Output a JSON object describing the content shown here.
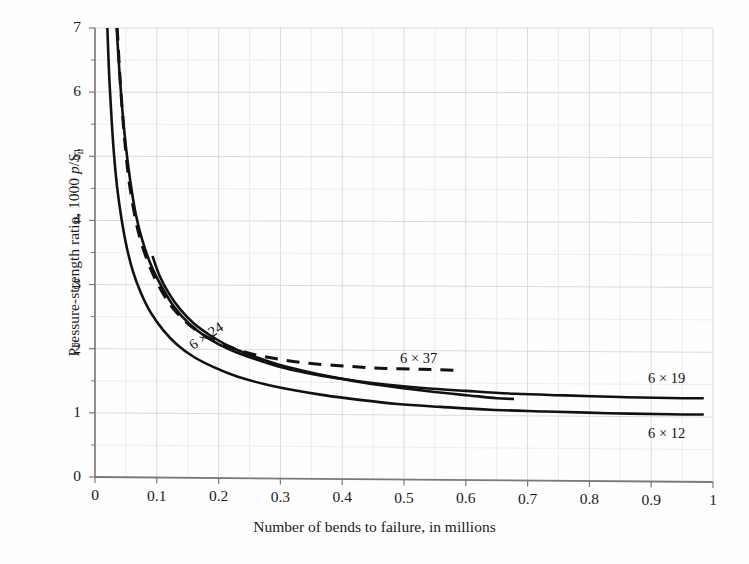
{
  "chart_data": {
    "type": "line",
    "title": "",
    "xlabel": "Number of bends to failure, in millions",
    "ylabel": "Pressure-strength ratio, 1000 p/Su",
    "ylabel_parts": {
      "prefix": "Pressure-strength ratio, 1000 ",
      "p": "p",
      "slash": "/",
      "S": "S",
      "sub": "u"
    },
    "xlim": [
      0,
      1
    ],
    "ylim": [
      0,
      7
    ],
    "xticks": [
      "0",
      "0.1",
      "0.2",
      "0.3",
      "0.4",
      "0.5",
      "0.6",
      "0.7",
      "0.8",
      "0.9",
      "1"
    ],
    "xtick_values": [
      0,
      0.1,
      0.2,
      0.3,
      0.4,
      0.5,
      0.6,
      0.7,
      0.8,
      0.9,
      1
    ],
    "yticks": [
      "0",
      "1",
      "2",
      "3",
      "4",
      "5",
      "6",
      "7"
    ],
    "ytick_values": [
      0,
      1,
      2,
      3,
      4,
      5,
      6,
      7
    ],
    "grid": true,
    "grid_minor_x_step": 0.05,
    "grid_minor_y_step": 0.5,
    "legend_position": "inline-labels",
    "axis_color": "#7a7a7a",
    "grid_color": "#d7d7d7",
    "curve_color": "#111111",
    "series": [
      {
        "name": "6 x 37",
        "label": "6 × 37",
        "style": "dashed",
        "points": [
          [
            0.036,
            7.0
          ],
          [
            0.04,
            6.3
          ],
          [
            0.045,
            5.6
          ],
          [
            0.05,
            5.05
          ],
          [
            0.056,
            4.55
          ],
          [
            0.065,
            4.05
          ],
          [
            0.075,
            3.65
          ],
          [
            0.09,
            3.25
          ],
          [
            0.105,
            2.95
          ],
          [
            0.125,
            2.65
          ],
          [
            0.15,
            2.4
          ],
          [
            0.18,
            2.2
          ],
          [
            0.215,
            2.05
          ],
          [
            0.255,
            1.93
          ],
          [
            0.3,
            1.85
          ],
          [
            0.35,
            1.79
          ],
          [
            0.41,
            1.75
          ],
          [
            0.47,
            1.72
          ],
          [
            0.53,
            1.71
          ],
          [
            0.58,
            1.7
          ]
        ]
      },
      {
        "name": "6 x 19",
        "label": "6 × 19",
        "style": "solid",
        "points": [
          [
            0.035,
            7.0
          ],
          [
            0.039,
            6.4
          ],
          [
            0.044,
            5.75
          ],
          [
            0.05,
            5.15
          ],
          [
            0.057,
            4.62
          ],
          [
            0.066,
            4.1
          ],
          [
            0.077,
            3.68
          ],
          [
            0.091,
            3.3
          ],
          [
            0.108,
            2.97
          ],
          [
            0.128,
            2.66
          ],
          [
            0.152,
            2.4
          ],
          [
            0.182,
            2.18
          ],
          [
            0.218,
            2.0
          ],
          [
            0.26,
            1.85
          ],
          [
            0.305,
            1.72
          ],
          [
            0.355,
            1.62
          ],
          [
            0.41,
            1.54
          ],
          [
            0.47,
            1.47
          ],
          [
            0.53,
            1.42
          ],
          [
            0.6,
            1.38
          ],
          [
            0.68,
            1.34
          ],
          [
            0.76,
            1.32
          ],
          [
            0.85,
            1.3
          ],
          [
            0.93,
            1.29
          ],
          [
            0.985,
            1.29
          ]
        ]
      },
      {
        "name": "6 x 24",
        "label": "6 × 24",
        "style": "solid",
        "points": [
          [
            0.093,
            3.45
          ],
          [
            0.105,
            3.13
          ],
          [
            0.12,
            2.86
          ],
          [
            0.138,
            2.62
          ],
          [
            0.16,
            2.4
          ],
          [
            0.186,
            2.22
          ],
          [
            0.215,
            2.06
          ],
          [
            0.25,
            1.92
          ],
          [
            0.29,
            1.79
          ],
          [
            0.335,
            1.68
          ],
          [
            0.385,
            1.58
          ],
          [
            0.44,
            1.49
          ],
          [
            0.495,
            1.42
          ],
          [
            0.55,
            1.36
          ],
          [
            0.605,
            1.31
          ],
          [
            0.65,
            1.27
          ],
          [
            0.678,
            1.26
          ]
        ]
      },
      {
        "name": "6 x 12",
        "label": "6 × 12",
        "style": "solid",
        "points": [
          [
            0.02,
            7.0
          ],
          [
            0.023,
            6.25
          ],
          [
            0.027,
            5.55
          ],
          [
            0.031,
            5.0
          ],
          [
            0.036,
            4.5
          ],
          [
            0.043,
            4.02
          ],
          [
            0.051,
            3.6
          ],
          [
            0.061,
            3.22
          ],
          [
            0.074,
            2.88
          ],
          [
            0.09,
            2.57
          ],
          [
            0.11,
            2.3
          ],
          [
            0.133,
            2.07
          ],
          [
            0.16,
            1.88
          ],
          [
            0.193,
            1.72
          ],
          [
            0.23,
            1.58
          ],
          [
            0.272,
            1.47
          ],
          [
            0.318,
            1.38
          ],
          [
            0.37,
            1.3
          ],
          [
            0.428,
            1.23
          ],
          [
            0.49,
            1.17
          ],
          [
            0.56,
            1.13
          ],
          [
            0.64,
            1.09
          ],
          [
            0.73,
            1.07
          ],
          [
            0.83,
            1.05
          ],
          [
            0.93,
            1.04
          ],
          [
            0.985,
            1.04
          ]
        ]
      }
    ],
    "annotations": [
      {
        "text": "6 × 24",
        "x_px": 186,
        "y_px": 339,
        "rotation": -33
      },
      {
        "text": "6 × 37",
        "x_px": 400,
        "y_px": 350,
        "rotation": 0
      },
      {
        "text": "6 × 19",
        "x_px": 648,
        "y_px": 370,
        "rotation": 0
      },
      {
        "text": "6 × 12",
        "x_px": 648,
        "y_px": 425,
        "rotation": 0
      }
    ]
  }
}
